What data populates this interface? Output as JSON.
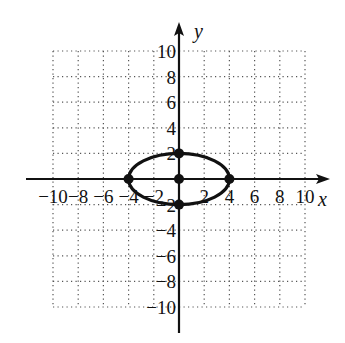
{
  "chart_data": {
    "type": "scatter",
    "title": "",
    "xlabel": "x",
    "ylabel": "y",
    "xlim": [
      -10,
      10
    ],
    "ylim": [
      -10,
      10
    ],
    "grid": true,
    "x_ticks": [
      -10,
      -8,
      -6,
      -4,
      -2,
      2,
      4,
      6,
      8,
      10
    ],
    "y_ticks": [
      -10,
      -8,
      -6,
      -4,
      -2,
      2,
      4,
      6,
      8,
      10
    ],
    "x_tick_labels": [
      "−10",
      "−8",
      "−6",
      "−4",
      "−2",
      "2",
      "4",
      "6",
      "8",
      "10"
    ],
    "y_tick_labels": [
      "−10",
      "−8",
      "−6",
      "−4",
      "−2",
      "2",
      "4",
      "6",
      "8",
      "10"
    ],
    "curves": [
      {
        "name": "ellipse",
        "shape": "ellipse",
        "center": [
          0,
          0
        ],
        "semi_major_x": 4,
        "semi_minor_y": 2,
        "equation": "x^2/16 + y^2/4 = 1"
      }
    ],
    "points": [
      {
        "label": "center",
        "x": 0,
        "y": 0
      },
      {
        "label": "vertex-left",
        "x": -4,
        "y": 0
      },
      {
        "label": "vertex-right",
        "x": 4,
        "y": 0
      },
      {
        "label": "co-vertex-top",
        "x": 0,
        "y": 2
      },
      {
        "label": "co-vertex-bottom",
        "x": 0,
        "y": -2
      }
    ]
  },
  "axes": {
    "x_label": "x",
    "y_label": "y"
  },
  "colors": {
    "ink": "#111111",
    "grid": "#555555",
    "background": "#ffffff"
  }
}
